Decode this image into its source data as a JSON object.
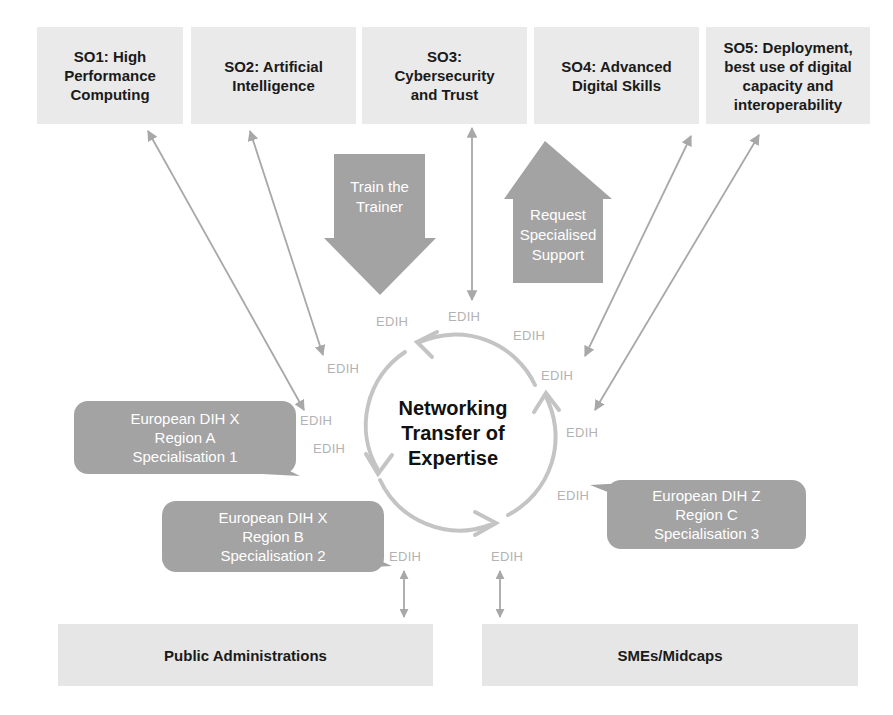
{
  "strategic_objectives": [
    {
      "id": "SO1",
      "label": "SO1: High\nPerformance\nComputing"
    },
    {
      "id": "SO2",
      "label": "SO2: Artificial\nIntelligence"
    },
    {
      "id": "SO3",
      "label": "SO3:\nCybersecurity\nand Trust"
    },
    {
      "id": "SO4",
      "label": "SO4: Advanced\nDigital Skills"
    },
    {
      "id": "SO5",
      "label": "SO5: Deployment,\nbest use of digital\ncapacity and\ninteroperability"
    }
  ],
  "flows": {
    "train_the_trainer": "Train the\nTrainer",
    "request_specialised_support": "Request\nSpecialised\nSupport"
  },
  "center": {
    "label": "Networking\nTransfer of\nExpertise"
  },
  "edih_label": "EDIH",
  "hubs": [
    {
      "label": "European DIH X\nRegion A\nSpecialisation 1"
    },
    {
      "label": "European DIH X\nRegion B\nSpecialisation 2"
    },
    {
      "label": "European DIH Z\nRegion C\nSpecialisation 3"
    }
  ],
  "stakeholders": [
    {
      "label": "Public Administrations"
    },
    {
      "label": "SMEs/Midcaps"
    }
  ],
  "colors": {
    "box_fill": "#eaeaea",
    "bubble_fill": "#a3a3a3",
    "arrow_gray": "#a8a8a8",
    "edih_text": "#b3b3b3",
    "cycle_arrow": "#c4c4c4"
  }
}
